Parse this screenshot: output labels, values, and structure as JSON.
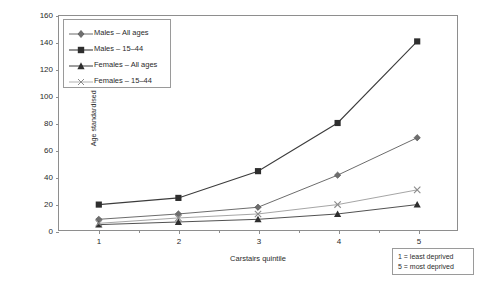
{
  "chart_data": {
    "type": "line",
    "title": "",
    "subtitle": "",
    "xlabel": "Carstairs quintile",
    "ylabel": "Age standardised rate per million",
    "categories": [
      "1",
      "2",
      "3",
      "4",
      "5"
    ],
    "x": [
      1,
      2,
      3,
      4,
      5
    ],
    "xlim": [
      0.5,
      5.5
    ],
    "ylim": [
      0,
      160
    ],
    "yticks": [
      0,
      20,
      40,
      60,
      80,
      100,
      120,
      140,
      160
    ],
    "grid": false,
    "legend_position": "top-left",
    "series": [
      {
        "name": "Males – All ages",
        "marker": "diamond",
        "color": "#5a5a5a",
        "values": [
          8,
          12,
          17,
          41,
          69
        ]
      },
      {
        "name": "Males – 15–44",
        "marker": "square",
        "color": "#3c3c3c",
        "values": [
          19,
          24,
          44,
          80,
          141
        ]
      },
      {
        "name": "Females – All ages",
        "marker": "triangle",
        "color": "#3c3c3c",
        "values": [
          4,
          6,
          8,
          12,
          19
        ]
      },
      {
        "name": "Females – 15–44",
        "marker": "cross",
        "color": "#9a9a9a",
        "values": [
          5,
          9,
          12,
          19,
          30
        ]
      }
    ],
    "annotations": [
      "1 = least deprived",
      "5 = most deprived"
    ]
  },
  "legend": {
    "entries": [
      {
        "label": "Males – All ages"
      },
      {
        "label": "Males – 15–44"
      },
      {
        "label": "Females – All ages"
      },
      {
        "label": "Females – 15–44"
      }
    ]
  },
  "note": {
    "line1": "1 = least deprived",
    "line2": "5 = most deprived"
  },
  "axes": {
    "y_title": "Age standardised rate per million",
    "x_title": "Carstairs quintile",
    "y_ticks": [
      "0",
      "20",
      "40",
      "60",
      "80",
      "100",
      "120",
      "140",
      "160"
    ],
    "x_ticks": [
      "1",
      "2",
      "3",
      "4",
      "5"
    ]
  },
  "colors": {
    "axis": "#8e8e8e",
    "text": "#2a2a2a",
    "series_dark": "#3c3c3c",
    "series_mid": "#5a5a5a",
    "series_light": "#9a9a9a"
  }
}
